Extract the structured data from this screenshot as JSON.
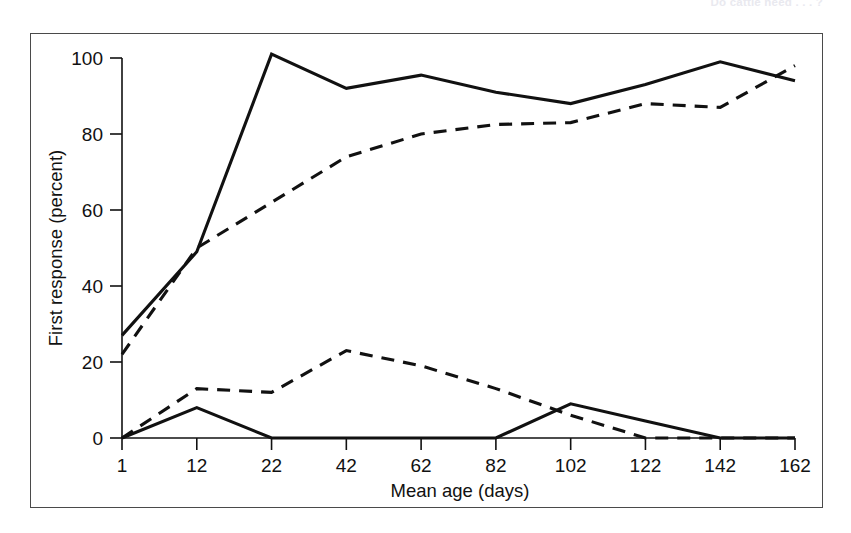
{
  "running_head": {
    "text": "Do cattle need . . . ?"
  },
  "figure": {
    "frame_color": "#4a4a4a",
    "background": "#ffffff"
  },
  "chart_data": {
    "type": "line",
    "title": "",
    "subtitle": "",
    "xlabel": "Mean age (days)",
    "ylabel": "First response (percent)",
    "x": [
      1,
      12,
      22,
      42,
      62,
      82,
      102,
      122,
      142,
      162
    ],
    "xtick_labels": [
      "1",
      "12",
      "22",
      "42",
      "62",
      "82",
      "102",
      "122",
      "142",
      "162"
    ],
    "ytick_labels": [
      "0",
      "20",
      "40",
      "60",
      "80",
      "100"
    ],
    "yticks": [
      0,
      20,
      40,
      60,
      80,
      100
    ],
    "xlim": [
      1,
      162
    ],
    "ylim": [
      0,
      105
    ],
    "grid": false,
    "legend": "none",
    "line_color": "#111111",
    "series": [
      {
        "name": "upper-solid",
        "style": "solid",
        "values": [
          27,
          49,
          101,
          92,
          95.5,
          91,
          88,
          93,
          99,
          94
        ]
      },
      {
        "name": "upper-dashed",
        "style": "dashed",
        "values": [
          22,
          50,
          62,
          74,
          80,
          82.5,
          83,
          88,
          87,
          98
        ]
      },
      {
        "name": "lower-dashed",
        "style": "dashed",
        "values": [
          0,
          13,
          12,
          23,
          19,
          13,
          6,
          0,
          0,
          0
        ]
      },
      {
        "name": "lower-solid",
        "style": "solid",
        "values": [
          0,
          8,
          0,
          0,
          0,
          0,
          9,
          4.5,
          0,
          0
        ]
      }
    ]
  }
}
